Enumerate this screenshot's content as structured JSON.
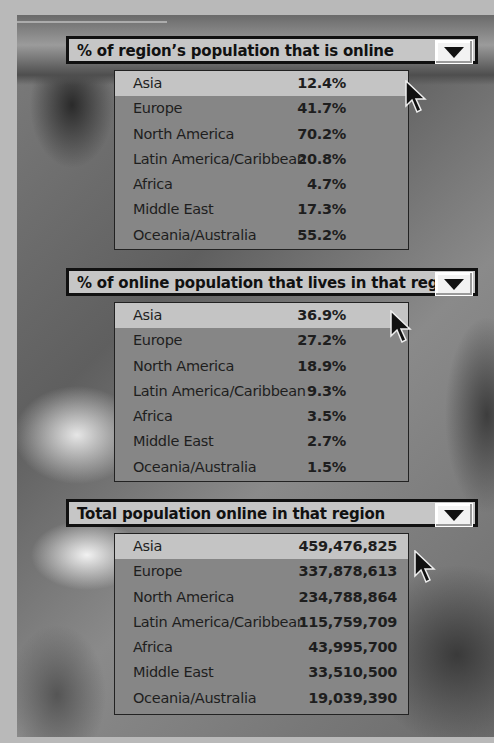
{
  "panels": [
    {
      "title": "% of region’s population that is online",
      "dropdown_icon": "triangle-down",
      "rows": [
        {
          "region": "Asia",
          "value": "12.4%",
          "highlighted": true
        },
        {
          "region": "Europe",
          "value": "41.7%"
        },
        {
          "region": "North America",
          "value": "70.2%"
        },
        {
          "region": "Latin America/Caribbean",
          "value": "20.8%"
        },
        {
          "region": "Africa",
          "value": "4.7%"
        },
        {
          "region": "Middle East",
          "value": "17.3%"
        },
        {
          "region": "Oceania/Australia",
          "value": "55.2%"
        }
      ]
    },
    {
      "title": "% of online population that lives in that region",
      "dropdown_icon": "triangle-down",
      "rows": [
        {
          "region": "Asia",
          "value": "36.9%",
          "highlighted": true
        },
        {
          "region": "Europe",
          "value": "27.2%"
        },
        {
          "region": "North America",
          "value": "18.9%"
        },
        {
          "region": "Latin America/Caribbean",
          "value": "9.3%"
        },
        {
          "region": "Africa",
          "value": "3.5%"
        },
        {
          "region": "Middle East",
          "value": "2.7%"
        },
        {
          "region": "Oceania/Australia",
          "value": "1.5%"
        }
      ]
    },
    {
      "title": "Total population online in that region",
      "dropdown_icon": "triangle-down",
      "rows": [
        {
          "region": "Asia",
          "value": "459,476,825",
          "highlighted": true
        },
        {
          "region": "Europe",
          "value": "337,878,613"
        },
        {
          "region": "North America",
          "value": "234,788,864"
        },
        {
          "region": "Latin America/Caribbean",
          "value": "115,759,709"
        },
        {
          "region": "Africa",
          "value": "43,995,700"
        },
        {
          "region": "Middle East",
          "value": "33,510,500"
        },
        {
          "region": "Oceania/Australia",
          "value": "19,039,390"
        }
      ]
    }
  ],
  "colors": {
    "header_bg": "#c6c6c6",
    "list_bg": "#868686",
    "highlight_bg": "#c4c4c4",
    "border": "#111111"
  }
}
